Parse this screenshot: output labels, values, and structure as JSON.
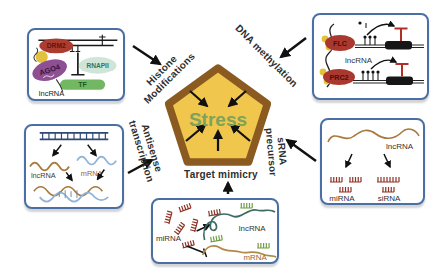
{
  "pentagon": {
    "label": "Stress"
  },
  "mechanism_labels": {
    "histone_line1": "Histone",
    "histone_line2": "Modifications",
    "dna_methylation": "DNA methylation",
    "antisense_line1": "Antisense",
    "antisense_line2": "transcription",
    "srna_line1": "sRNA",
    "srna_line2": "precursor",
    "target_mimicry": "Target mimicry"
  },
  "histone_box": {
    "drm2": "DRM2",
    "ago4": "AGO4",
    "rnapii": "RNAPII",
    "tf": "TF",
    "lncrna": "lncRNA"
  },
  "methylation_box": {
    "flc": "FLC",
    "prc2": "PRC2",
    "lncrna": "lncRNA"
  },
  "antisense_box": {
    "lncrna": "lncRNA",
    "mrna": "mRNA"
  },
  "srna_box": {
    "lncrna": "lncRNA",
    "mirna": "miRNA",
    "sirna": "siRNA"
  },
  "mimicry_box": {
    "mirna": "miRNA",
    "lncrna": "lncRNA",
    "mrna": "mRNA"
  },
  "colors": {
    "pentagon_fill": "#f0c64d",
    "pentagon_border": "#8a5a20",
    "stress_text": "#7ea25a",
    "box_border": "#4a6fa5",
    "protein_red": "#ac3c30",
    "ago4_purple": "#8e4f93",
    "rnapii_teal": "#cfe5d8",
    "tf_green": "#72b862",
    "dot_yellow": "#e2c23c",
    "lncrna_brown": "#a87a3f",
    "mrna_blue": "#8fb3d9",
    "lncrna_teal": "#3d6b63",
    "mirna_red": "#8f3325",
    "comb_green": "#6f9e45",
    "repression_red": "#b03028"
  }
}
